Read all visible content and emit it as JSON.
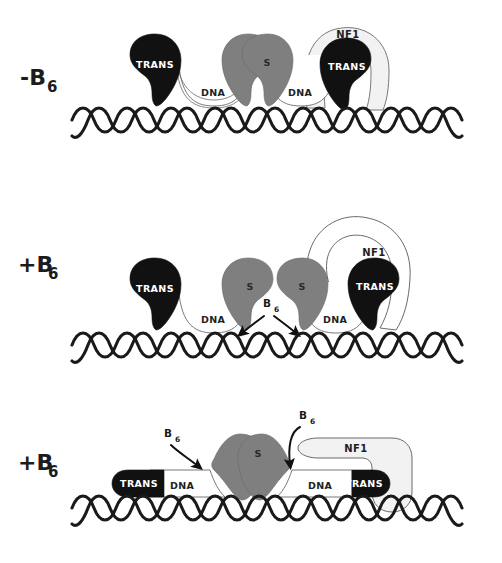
{
  "figure": {
    "background_color": "#ffffff",
    "width": 502,
    "height": 563
  },
  "palette": {
    "trans_fill": "#111111",
    "s_fill": "#7f7f7f",
    "nf1_fill": "#f2f2f2",
    "dna_loop_fill": "#ffffff",
    "outline": "#4a4a4a",
    "helix_stroke": "#1a1a1a",
    "text_dark": "#1f1f1f",
    "text_light": "#ffffff"
  },
  "panels": [
    {
      "id": "panel-top",
      "condition_sign": "-",
      "condition_base": "B",
      "condition_subscript": "6",
      "condition_full": "-B6",
      "state": "repressed-looped",
      "elements": {
        "trans_left_label": "TRANS",
        "trans_right_label": "TRANS",
        "s_left_label": "S",
        "s_right_label": "S",
        "dna_left_label": "DNA",
        "dna_right_label": "DNA",
        "nf1_label": "NF1"
      },
      "annotations": []
    },
    {
      "id": "panel-middle",
      "condition_sign": "+",
      "condition_base": "B",
      "condition_subscript": "6",
      "condition_full": "+B6",
      "state": "b6-entering",
      "elements": {
        "trans_left_label": "TRANS",
        "trans_right_label": "TRANS",
        "s_left_label": "S",
        "s_right_label": "S",
        "dna_left_label": "DNA",
        "dna_right_label": "DNA",
        "nf1_label": "NF1"
      },
      "annotations": [
        {
          "id": "b6-center",
          "base": "B",
          "subscript": "6",
          "full": "B6",
          "arrows": [
            "down-left",
            "down-right"
          ]
        }
      ]
    },
    {
      "id": "panel-bottom",
      "condition_sign": "+",
      "condition_base": "B",
      "condition_subscript": "6",
      "condition_full": "+B6",
      "state": "activated-flattened",
      "elements": {
        "trans_left_label": "TRANS",
        "trans_right_label": "TRANS",
        "s_left_label": "S",
        "s_right_label": "S",
        "dna_left_label": "DNA",
        "dna_right_label": "DNA",
        "nf1_label": "NF1"
      },
      "annotations": [
        {
          "id": "b6-left",
          "base": "B",
          "subscript": "6",
          "full": "B6",
          "arrows": [
            "down-right"
          ]
        },
        {
          "id": "b6-right",
          "base": "B",
          "subscript": "6",
          "full": "B6",
          "arrows": [
            "down"
          ]
        }
      ]
    }
  ]
}
